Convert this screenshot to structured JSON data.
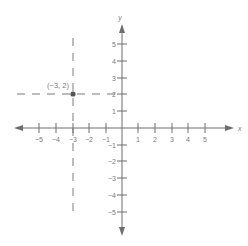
{
  "diagram": {
    "type": "coordinate-plane",
    "axes": {
      "x_label": "x",
      "y_label": "y",
      "x_ticks": [
        "−5",
        "−4",
        "−3",
        "−2",
        "−1",
        "1",
        "2",
        "3",
        "4",
        "5"
      ],
      "y_ticks": [
        "5",
        "4",
        "3",
        "2",
        "1",
        "−1",
        "−2",
        "−3",
        "−4",
        "−5"
      ],
      "range": [
        -5,
        5
      ]
    },
    "point": {
      "label": "(−3, 2)",
      "x": -3,
      "y": 2
    },
    "guides": {
      "vertical_dashed_at_x": -3,
      "horizontal_dashed_at_y": 2
    },
    "colors": {
      "axis": "#6e6e6e",
      "dashed": "#7a7a7a",
      "point": "#555555",
      "text": "#7a7a7a"
    }
  }
}
